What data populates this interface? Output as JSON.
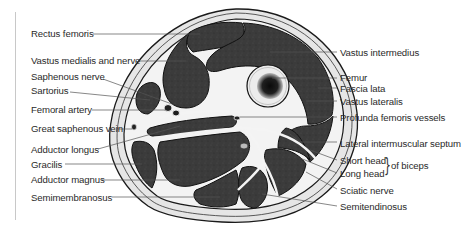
{
  "left_labels": [
    {
      "text": "Rectus femoris"
    },
    {
      "text": "Vastus medialis and nerve"
    },
    {
      "text": "Saphenous nerve"
    },
    {
      "text": "Sartorius"
    },
    {
      "text": "Femoral artery"
    },
    {
      "text": "Great saphenous vein"
    },
    {
      "text": "Adductor longus"
    },
    {
      "text": "Gracilis"
    },
    {
      "text": "Adductor magnus"
    },
    {
      "text": "Semimembranosus"
    }
  ],
  "right_labels": [
    {
      "text": "Vastus intermedius"
    },
    {
      "text": "Femur"
    },
    {
      "text": "Fascia lata"
    },
    {
      "text": "Vastus lateralis"
    },
    {
      "text": "Profunda femoris vessels"
    },
    {
      "text": "Lateral intermuscular septum"
    },
    {
      "text": "Short head"
    },
    {
      "text": "Long head"
    },
    {
      "text": "Sciatic nerve"
    },
    {
      "text": "Semitendinosus"
    }
  ],
  "biceps_group": {
    "brace": "}",
    "text": "of biceps"
  },
  "colors": {
    "muscle": "#3a3a3a",
    "muscle_dark": "#262626",
    "fascia": "#f2f2f2",
    "fat": "#e4e4e4",
    "bone": "#ececec",
    "marrow": "#111111",
    "leader": "#555555",
    "outline": "#1a1a1a"
  }
}
